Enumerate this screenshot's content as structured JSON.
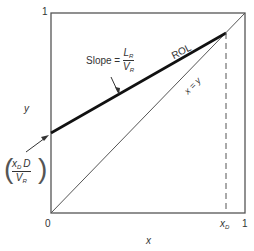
{
  "diagram": {
    "type": "mccabe-thiele-rectifying-operating-line",
    "axes": {
      "x_label": "x",
      "y_label": "y",
      "x_origin_label": "0",
      "x_max_label": "1",
      "y_max_label": "1",
      "xd_label": "x",
      "xd_sub": "D"
    },
    "lines": {
      "rol_label": "ROL",
      "diagonal_label": "x = y"
    },
    "slope_annotation": {
      "prefix": "Slope =",
      "numerator": "L",
      "numerator_sub": "R",
      "denominator": "V",
      "denominator_sub": "R"
    },
    "intercept_annotation": {
      "numerator_a": "x",
      "numerator_a_sub": "D",
      "numerator_b": "D",
      "denominator": "V",
      "denominator_sub": "R"
    },
    "colors": {
      "frame": "#555555",
      "rol": "#111111",
      "text": "#333333"
    }
  }
}
